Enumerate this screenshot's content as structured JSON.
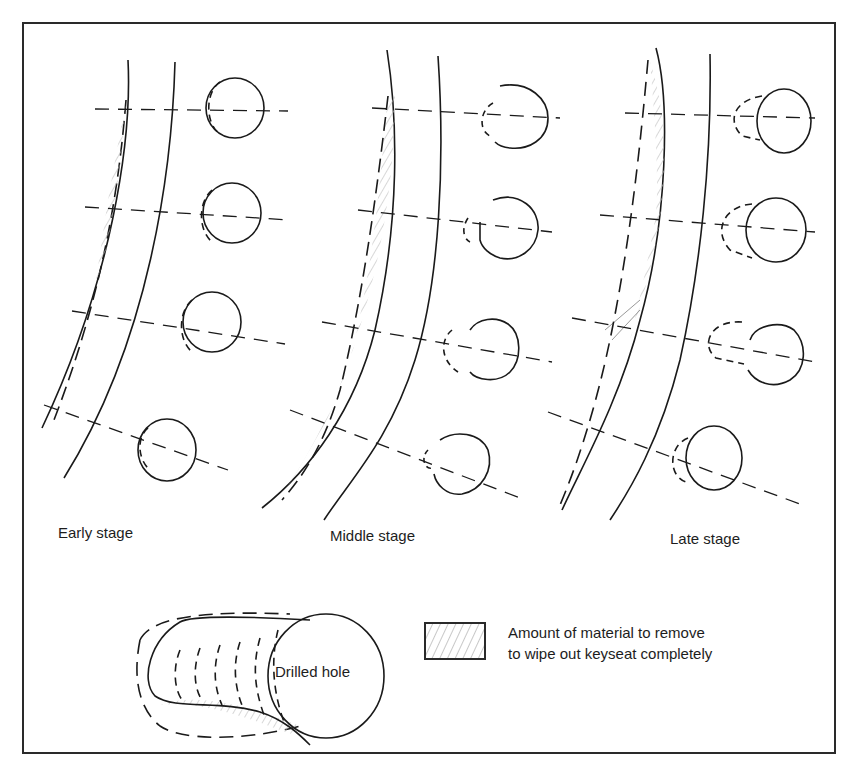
{
  "figure": {
    "frame_color": "#2a2a2a",
    "line_color": "#1a1a1a",
    "hatch_color": "#bdbdbd"
  },
  "stages": [
    {
      "label": "Early stage"
    },
    {
      "label": "Middle stage"
    },
    {
      "label": "Late stage"
    }
  ],
  "detail": {
    "hole_label": "Drilled hole"
  },
  "legend": {
    "swatch_desc": "hatched-area",
    "line1": "Amount of material to remove",
    "line2": "to wipe out keyseat completely"
  }
}
